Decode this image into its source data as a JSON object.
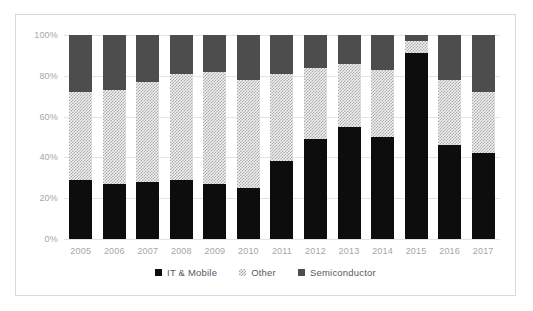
{
  "chart_data": {
    "type": "bar",
    "stacked": true,
    "stack_mode": "percent",
    "title": "",
    "xlabel": "",
    "ylabel": "",
    "ylim": [
      0,
      100
    ],
    "ytick_labels": [
      "0%",
      "20%",
      "40%",
      "60%",
      "80%",
      "100%"
    ],
    "ytick_values": [
      0,
      20,
      40,
      60,
      80,
      100
    ],
    "grid": true,
    "legend_position": "bottom",
    "categories": [
      "2005",
      "2006",
      "2007",
      "2008",
      "2009",
      "2010",
      "2011",
      "2012",
      "2013",
      "2014",
      "2015",
      "2016",
      "2017"
    ],
    "series": [
      {
        "name": "IT & Mobile",
        "color": "#0d0d0d",
        "values": [
          29,
          27,
          28,
          29,
          27,
          25,
          38,
          49,
          55,
          50,
          91,
          46,
          42
        ]
      },
      {
        "name": "Other",
        "color": "#f2f2f2",
        "pattern": "hatch",
        "values": [
          43,
          46,
          49,
          52,
          55,
          53,
          43,
          35,
          31,
          33,
          6,
          32,
          30
        ]
      },
      {
        "name": "Semiconductor",
        "color": "#4d4d4d",
        "values": [
          28,
          27,
          23,
          19,
          18,
          22,
          19,
          16,
          14,
          17,
          3,
          22,
          28
        ]
      }
    ]
  },
  "legend": {
    "items": [
      {
        "label": "IT & Mobile",
        "swatch": "square-black-icon"
      },
      {
        "label": "Other",
        "swatch": "square-hatch-icon"
      },
      {
        "label": "Semiconductor",
        "swatch": "square-gray-icon"
      }
    ]
  },
  "colors": {
    "it_mobile": "#0d0d0d",
    "other": "#f2f2f2",
    "semiconductor": "#4d4d4d",
    "gridline": "#e4e4e4",
    "tick_text": "#a6a6a6",
    "legend_text": "#595959",
    "frame_border": "#d9d9d9",
    "background": "#ffffff"
  }
}
